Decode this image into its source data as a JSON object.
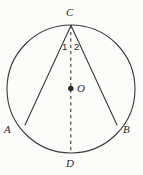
{
  "figure": {
    "type": "geometry-diagram",
    "background_color": "#fcfcfb",
    "stroke_color": "#3a3a3a",
    "labels": {
      "C": "C",
      "D": "D",
      "A": "A",
      "B": "B",
      "O": "O",
      "angle_1": "1",
      "angle_2": "2"
    },
    "points": {
      "C": {
        "x": 71,
        "y": 25
      },
      "D": {
        "x": 71,
        "y": 153
      },
      "A": {
        "x": 25,
        "y": 125
      },
      "B": {
        "x": 117,
        "y": 125
      },
      "O": {
        "x": 70.5,
        "y": 88.5
      }
    },
    "circle": {
      "cx": 71,
      "cy": 89,
      "r": 64
    },
    "segments": [
      {
        "name": "chord-CA",
        "from": "C",
        "to": "A",
        "style": "solid"
      },
      {
        "name": "chord-CB",
        "from": "C",
        "to": "B",
        "style": "solid"
      },
      {
        "name": "diameter-CD",
        "from": "C",
        "to": "D",
        "style": "dashed"
      }
    ]
  }
}
